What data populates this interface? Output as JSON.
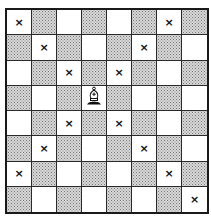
{
  "diagram": {
    "title": "",
    "board": {
      "size": 8,
      "top_left_color": "light",
      "light_color": "#ffffff",
      "dark_color": "#d8d8d8",
      "border_color": "#1a1a1a"
    },
    "mark_symbol": "×",
    "piece": {
      "type": "bishop",
      "color": "white",
      "row": 3,
      "col": 3
    },
    "marks": [
      {
        "row": 0,
        "col": 0
      },
      {
        "row": 0,
        "col": 6
      },
      {
        "row": 1,
        "col": 1
      },
      {
        "row": 1,
        "col": 5
      },
      {
        "row": 2,
        "col": 2
      },
      {
        "row": 2,
        "col": 4
      },
      {
        "row": 4,
        "col": 2
      },
      {
        "row": 4,
        "col": 4
      },
      {
        "row": 5,
        "col": 1
      },
      {
        "row": 5,
        "col": 5
      },
      {
        "row": 6,
        "col": 0
      },
      {
        "row": 6,
        "col": 6
      },
      {
        "row": 7,
        "col": 7
      }
    ]
  }
}
